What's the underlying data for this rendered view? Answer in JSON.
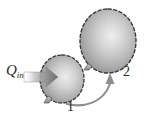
{
  "figure": {
    "background_color": "#ffffff",
    "width": 146,
    "height": 122
  },
  "labels": {
    "heat_symbol": "Q",
    "heat_subscript": "in",
    "state_1": "1",
    "state_2": "2"
  },
  "colors": {
    "outline": "#3a3a3a",
    "balloon_light": "#e8e8e8",
    "balloon_mid": "#b6b6b6",
    "balloon_dark": "#8c8c8c",
    "arrow_gray": "#9a9a9a",
    "process_arrow": "#8e8e8e",
    "text": "#2b2b2b"
  },
  "elements": {
    "small_balloon": {
      "name": "balloon-state-1",
      "center_x": 62,
      "center_y": 79,
      "radius_x": 22,
      "radius_y": 24,
      "outline_style": "dashed"
    },
    "large_balloon": {
      "name": "balloon-state-2",
      "center_x": 108,
      "center_y": 41,
      "radius_x": 28,
      "radius_y": 32,
      "outline_style": "dashed"
    },
    "heat_arrow": {
      "name": "heat-in-arrow",
      "direction": "right",
      "style": "block-arrow-gradient"
    },
    "process_arrow": {
      "name": "process-arrow-1-to-2",
      "direction": "curved-up-right",
      "from_state": "1",
      "to_state": "2"
    }
  }
}
